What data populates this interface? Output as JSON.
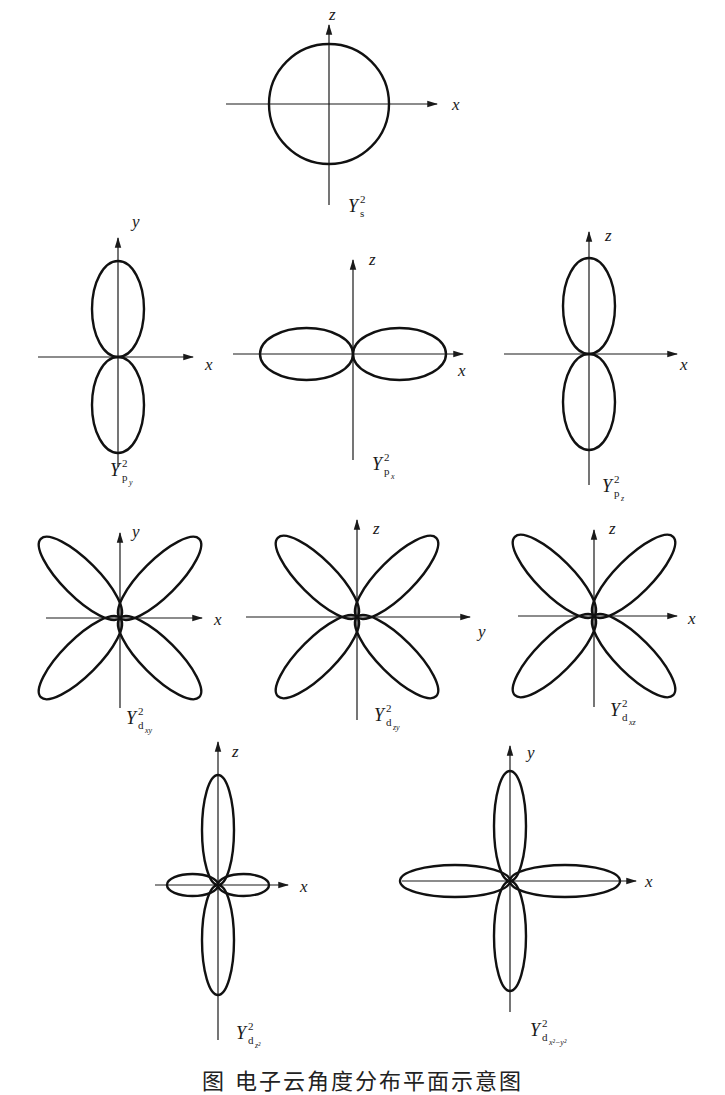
{
  "figure": {
    "caption": "图  电子云角度分布平面示意图",
    "colors": {
      "stroke": "#111111",
      "background": "#ffffff"
    }
  },
  "panels": [
    {
      "id": "s",
      "label_main": "Y",
      "label_sup": "2",
      "label_sub": "s",
      "label_subsub": "",
      "center": [
        329,
        104
      ],
      "h_axis": {
        "from": 226,
        "to": 437,
        "label": "x",
        "label_pos": [
          452,
          110
        ]
      },
      "v_axis": {
        "from": 205,
        "to": 25,
        "label": "z",
        "label_pos": [
          329,
          20
        ]
      },
      "shape": "circle",
      "radius": 60,
      "caption_pos": [
        348,
        212
      ]
    },
    {
      "id": "py",
      "label_main": "Y",
      "label_sup": "2",
      "label_sub": "p",
      "label_subsub": "y",
      "center": [
        118,
        357
      ],
      "h_axis": {
        "from": 38,
        "to": 193,
        "label": "y_x",
        "axis_name": "x",
        "label_pos": [
          205,
          370
        ]
      },
      "v_axis": {
        "from": 467,
        "to": 238,
        "label": "y",
        "label_pos": [
          132,
          227
        ]
      },
      "shape": "two-lobe-vertical",
      "lobe_length": 96,
      "lobe_halfwidth": 26,
      "caption_pos": [
        110,
        476
      ]
    },
    {
      "id": "px",
      "label_main": "Y",
      "label_sup": "2",
      "label_sub": "p",
      "label_subsub": "x",
      "center": [
        353,
        354
      ],
      "h_axis": {
        "from": 233,
        "to": 463,
        "label": "x",
        "label_pos": [
          458,
          376
        ]
      },
      "v_axis": {
        "from": 460,
        "to": 260,
        "label": "z",
        "label_pos": [
          369,
          265
        ]
      },
      "shape": "two-lobe-horizontal",
      "lobe_length": 93,
      "lobe_halfwidth": 26,
      "caption_pos": [
        372,
        470
      ]
    },
    {
      "id": "pz",
      "label_main": "Y",
      "label_sup": "2",
      "label_sub": "p",
      "label_subsub": "z",
      "center": [
        589,
        354
      ],
      "h_axis": {
        "from": 504,
        "to": 677,
        "label": "x",
        "label_pos": [
          680,
          370
        ]
      },
      "v_axis": {
        "from": 485,
        "to": 232,
        "label": "z",
        "label_pos": [
          605,
          241
        ]
      },
      "shape": "two-lobe-vertical",
      "lobe_length": 96,
      "lobe_halfwidth": 26,
      "caption_pos": [
        602,
        492
      ]
    },
    {
      "id": "dxy",
      "label_main": "Y",
      "label_sup": "2",
      "label_sub": "d",
      "label_subsub": "xy",
      "center": [
        120,
        618
      ],
      "h_axis": {
        "from": 46,
        "to": 202,
        "label": "x",
        "label_pos": [
          214,
          625
        ]
      },
      "v_axis": {
        "from": 708,
        "to": 533,
        "label": "y",
        "label_pos": [
          132,
          537
        ]
      },
      "shape": "four-lobe-diagonal",
      "lobe_length": 112,
      "lobe_halfwidth": 18,
      "caption_pos": [
        126,
        724
      ]
    },
    {
      "id": "dzy",
      "label_main": "Y",
      "label_sup": "2",
      "label_sub": "d",
      "label_subsub": "zy",
      "center": [
        357,
        617
      ],
      "h_axis": {
        "from": 246,
        "to": 470,
        "label": "y",
        "label_pos": [
          478,
          637
        ]
      },
      "v_axis": {
        "from": 720,
        "to": 520,
        "label": "z",
        "label_pos": [
          373,
          534
        ]
      },
      "shape": "four-lobe-diagonal",
      "lobe_length": 112,
      "lobe_halfwidth": 18,
      "caption_pos": [
        374,
        721
      ]
    },
    {
      "id": "dxz",
      "label_main": "Y",
      "label_sup": "2",
      "label_sub": "d",
      "label_subsub": "xz",
      "center": [
        594,
        616
      ],
      "h_axis": {
        "from": 518,
        "to": 677,
        "label": "x",
        "label_pos": [
          688,
          624
        ]
      },
      "v_axis": {
        "from": 707,
        "to": 530,
        "label": "z",
        "label_pos": [
          609,
          534
        ]
      },
      "shape": "four-lobe-diagonal",
      "lobe_length": 112,
      "lobe_halfwidth": 18,
      "caption_pos": [
        610,
        716
      ]
    },
    {
      "id": "dz2",
      "label_main": "Y",
      "label_sup": "2",
      "label_sub": "d",
      "label_subsub": "z²",
      "center": [
        218,
        885
      ],
      "h_axis": {
        "from": 155,
        "to": 288,
        "label": "x",
        "label_pos": [
          300,
          892
        ]
      },
      "v_axis": {
        "from": 1040,
        "to": 742,
        "label": "z",
        "label_pos": [
          232,
          757
        ]
      },
      "shape": "dz2",
      "lobe_length": 110,
      "lobe_halfwidth": 16,
      "small_lobe_length": 51,
      "small_lobe_halfwidth": 11,
      "caption_pos": [
        236,
        1039
      ]
    },
    {
      "id": "dx2y2",
      "label_main": "Y",
      "label_sup": "2",
      "label_sub": "d",
      "label_subsub": "x²−y²",
      "center": [
        510,
        881
      ],
      "h_axis": {
        "from": 402,
        "to": 636,
        "label": "x",
        "label_pos": [
          645,
          887
        ]
      },
      "v_axis": {
        "from": 1012,
        "to": 746,
        "label": "y",
        "label_pos": [
          527,
          758
        ]
      },
      "shape": "four-lobe-axis",
      "lobe_length": 110,
      "lobe_halfwidth": 16,
      "caption_pos": [
        530,
        1036
      ]
    }
  ]
}
